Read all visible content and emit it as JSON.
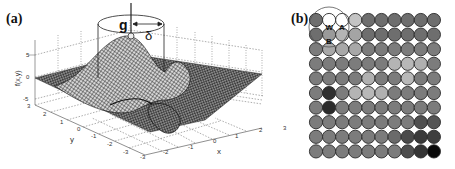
{
  "panels": {
    "a": {
      "label": "(a)",
      "zlabel": "f(x,y)",
      "xlabel": "x",
      "ylabel": "y",
      "z_ticks": [
        "5",
        "0",
        "-5"
      ],
      "x_ticks": [
        "-3",
        "-2",
        "-1",
        "0",
        "1",
        "2",
        "3"
      ],
      "y_ticks": [
        "3",
        "2",
        "1",
        "0",
        "-1",
        "-2",
        "-3"
      ],
      "annotation_point": "g",
      "annotation_radius": "δ"
    },
    "b": {
      "label": "(b)",
      "circle_labels": {
        "w": "W",
        "a": "A",
        "b": "B"
      },
      "rows": 10,
      "cols": 10,
      "shades": [
        [
          "#6e6e6e",
          "#ffffff",
          "#ffffff",
          "#c4c4c4",
          "#6e6e6e",
          "#6e6e6e",
          "#6e6e6e",
          "#6e6e6e",
          "#6e6e6e",
          "#6e6e6e"
        ],
        [
          "#6e6e6e",
          "#9a9a9a",
          "#b4b4b4",
          "#a4a4a4",
          "#6e6e6e",
          "#6e6e6e",
          "#6e6e6e",
          "#6e6e6e",
          "#6e6e6e",
          "#6e6e6e"
        ],
        [
          "#7c7c7c",
          "#a8a8a8",
          "#a8a8a8",
          "#a8a8a8",
          "#7c7c7c",
          "#7c7c7c",
          "#7c7c7c",
          "#7c7c7c",
          "#7c7c7c",
          "#7c7c7c"
        ],
        [
          "#7c7c7c",
          "#7c7c7c",
          "#7c7c7c",
          "#7c7c7c",
          "#7c7c7c",
          "#7c7c7c",
          "#b4b4b4",
          "#b8b8b8",
          "#b0b0b0",
          "#7c7c7c"
        ],
        [
          "#7c7c7c",
          "#7c7c7c",
          "#7c7c7c",
          "#7c7c7c",
          "#b0b0b0",
          "#7c7c7c",
          "#7c7c7c",
          "#b8b8b8",
          "#7c7c7c",
          "#7c7c7c"
        ],
        [
          "#7c7c7c",
          "#303030",
          "#7c7c7c",
          "#b4b4b4",
          "#b8b8b8",
          "#b0b0b0",
          "#7c7c7c",
          "#7c7c7c",
          "#7c7c7c",
          "#7c7c7c"
        ],
        [
          "#7c7c7c",
          "#2c2c2c",
          "#7c7c7c",
          "#7c7c7c",
          "#7c7c7c",
          "#7c7c7c",
          "#7c7c7c",
          "#7c7c7c",
          "#7c7c7c",
          "#7c7c7c"
        ],
        [
          "#7c7c7c",
          "#7c7c7c",
          "#7c7c7c",
          "#7c7c7c",
          "#7c7c7c",
          "#7c7c7c",
          "#7c7c7c",
          "#7c7c7c",
          "#505050",
          "#555555"
        ],
        [
          "#7c7c7c",
          "#7c7c7c",
          "#7c7c7c",
          "#7c7c7c",
          "#7c7c7c",
          "#7c7c7c",
          "#6a6a6a",
          "#4a4a4a",
          "#3a3a3a",
          "#3e3e3e"
        ],
        [
          "#7c7c7c",
          "#7c7c7c",
          "#7c7c7c",
          "#7c7c7c",
          "#7c7c7c",
          "#7c7c7c",
          "#7c7c7c",
          "#4e4e4e",
          "#353535",
          "#0a0a0a"
        ]
      ]
    }
  }
}
